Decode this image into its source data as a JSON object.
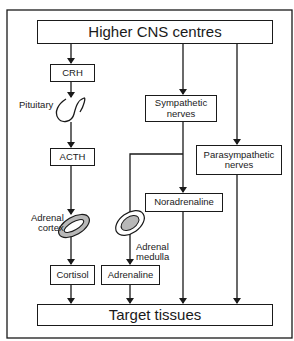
{
  "diagram": {
    "nodes": {
      "higher_cns": "Higher CNS centres",
      "crh": "CRH",
      "pituitary": "Pituitary",
      "acth": "ACTH",
      "adrenal_cortex": "Adrenal\ncortex",
      "cortisol": "Cortisol",
      "sympathetic": "Sympathetic\nnerves",
      "parasympathetic": "Parasympathetic\nnerves",
      "noradrenaline": "Noradrenaline",
      "adrenal_medulla": "Adrenal\nmedulla",
      "adrenaline": "Adrenaline",
      "target": "Target tissues"
    },
    "edges": [
      {
        "from": "Higher CNS centres",
        "to": "CRH"
      },
      {
        "from": "CRH",
        "to": "Pituitary"
      },
      {
        "from": "Pituitary",
        "to": "ACTH"
      },
      {
        "from": "ACTH",
        "to": "Adrenal cortex"
      },
      {
        "from": "Adrenal cortex",
        "to": "Cortisol"
      },
      {
        "from": "Cortisol",
        "to": "Target tissues"
      },
      {
        "from": "Higher CNS centres",
        "to": "Sympathetic nerves"
      },
      {
        "from": "Sympathetic nerves",
        "to": "Adrenal medulla"
      },
      {
        "from": "Adrenal medulla",
        "to": "Adrenaline"
      },
      {
        "from": "Adrenaline",
        "to": "Target tissues"
      },
      {
        "from": "Sympathetic nerves",
        "to": "Noradrenaline"
      },
      {
        "from": "Noradrenaline",
        "to": "Target tissues"
      },
      {
        "from": "Higher CNS centres",
        "to": "Parasympathetic nerves"
      },
      {
        "from": "Parasympathetic nerves",
        "to": "Target tissues"
      }
    ],
    "colors": {
      "line": "#1a1a1a",
      "organ_fill": "#b8b8b8",
      "background": "#ffffff"
    }
  }
}
